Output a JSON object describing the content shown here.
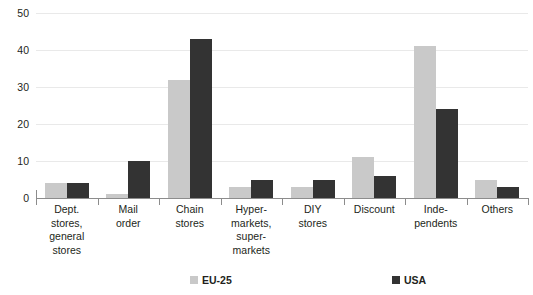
{
  "chart_data": {
    "type": "bar",
    "title": "",
    "xlabel": "",
    "ylabel": "",
    "ylim": [
      0,
      50
    ],
    "yticks": [
      0,
      10,
      20,
      30,
      40,
      50
    ],
    "grid": true,
    "legend_position": "bottom",
    "categories": [
      "Dept. stores, general stores",
      "Mail order",
      "Chain stores",
      "Hyper-markets, super-markets",
      "DIY stores",
      "Discount",
      "Inde-pendents",
      "Others"
    ],
    "category_lines": [
      [
        "Dept.",
        "stores,",
        "general",
        "stores"
      ],
      [
        "Mail",
        "order"
      ],
      [
        "Chain",
        "stores"
      ],
      [
        "Hyper-",
        "markets,",
        "super-",
        "markets"
      ],
      [
        "DIY",
        "stores"
      ],
      [
        "Discount"
      ],
      [
        "Inde-",
        "pendents"
      ],
      [
        "Others"
      ]
    ],
    "series": [
      {
        "name": "EU-25",
        "color": "#c9c9c9",
        "values": [
          4,
          1,
          32,
          3,
          3,
          11,
          41,
          5
        ]
      },
      {
        "name": "USA",
        "color": "#333333",
        "values": [
          4,
          10,
          43,
          5,
          5,
          6,
          24,
          3
        ]
      }
    ]
  },
  "axis": {
    "tick_labels": [
      "50",
      "40",
      "30",
      "20",
      "10",
      "0"
    ]
  },
  "legend": {
    "items": [
      {
        "label": "EU-25",
        "swatch": "eu"
      },
      {
        "label": "USA",
        "swatch": "usa"
      }
    ]
  }
}
